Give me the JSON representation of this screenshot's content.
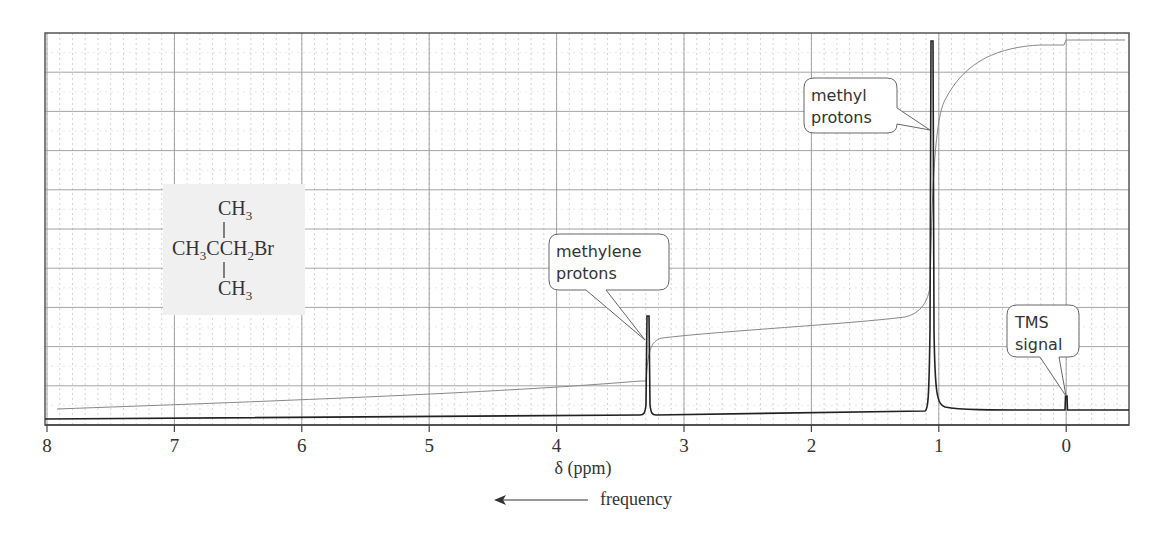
{
  "chart_data": {
    "type": "line",
    "title": "",
    "xlabel": "δ (ppm)",
    "ylabel": "",
    "x_direction": "reversed",
    "xlim": [
      8,
      -0.5
    ],
    "x_ticks": [
      8,
      7,
      6,
      5,
      4,
      3,
      2,
      1,
      0
    ],
    "x_tick_labels": [
      "8",
      "7",
      "6",
      "5",
      "4",
      "3",
      "2",
      "1",
      "0"
    ],
    "grid": true,
    "frequency_label": "frequency",
    "frequency_arrow_direction": "left",
    "compound": {
      "top": "CH",
      "top_sub": "3",
      "middle_a": "CH",
      "middle_a_sub": "3",
      "middle_b": "CCH",
      "middle_b_sub": "2",
      "middle_c": "Br",
      "bottom": "CH",
      "bottom_sub": "3"
    },
    "series": [
      {
        "name": "spectrum",
        "peaks": [
          {
            "delta": 3.28,
            "relative_height": 0.27,
            "label": "methylene protons"
          },
          {
            "delta": 1.05,
            "relative_height": 1.0,
            "label": "methyl protons"
          },
          {
            "delta": 0.0,
            "relative_height": 0.04,
            "label": "TMS signal"
          }
        ]
      },
      {
        "name": "integration",
        "steps": [
          {
            "delta_start": 8.0,
            "delta_end": 3.3,
            "relative_level": 0.03
          },
          {
            "delta_start": 3.28,
            "delta_end": 1.1,
            "relative_level": 0.25
          },
          {
            "delta_start": 1.05,
            "delta_end": 0.05,
            "relative_level": 0.97
          },
          {
            "delta_start": 0.0,
            "delta_end": -0.5,
            "relative_level": 0.99
          }
        ]
      }
    ],
    "annotations": [
      {
        "line1": "methylene",
        "line2": "protons",
        "delta": 3.28
      },
      {
        "line1": "methyl",
        "line2": "protons",
        "delta": 1.05
      },
      {
        "line1": "TMS",
        "line2": "signal",
        "delta": 0.0
      }
    ]
  }
}
